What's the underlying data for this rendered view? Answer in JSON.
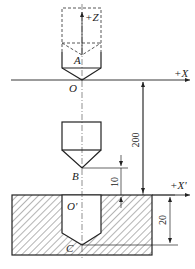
{
  "diagram": {
    "type": "CNC tool setting / coordinate offset diagram",
    "colors": {
      "line": "#222222",
      "hatch": "#444444",
      "background": "#ffffff"
    },
    "axes": {
      "z_axis_label": "+Z",
      "x_axis_label": "+X",
      "x_prime_axis_label": "+X'"
    },
    "points": {
      "A": "A",
      "O": "O",
      "B": "B",
      "O_prime": "O'",
      "C": "C"
    },
    "dimensions": {
      "tool_travel": "200",
      "approach_gap": "10",
      "hole_depth": "20"
    },
    "elements": [
      {
        "name": "tool-home-position",
        "style": "dashed",
        "label": "+Z"
      },
      {
        "name": "tool-at-origin",
        "tip": "O",
        "reference": "A"
      },
      {
        "name": "tool-above-workpiece",
        "tip": "B"
      },
      {
        "name": "workpiece",
        "style": "hatched",
        "origin": "O'"
      },
      {
        "name": "drilled-hole",
        "bottom": "C"
      }
    ]
  }
}
